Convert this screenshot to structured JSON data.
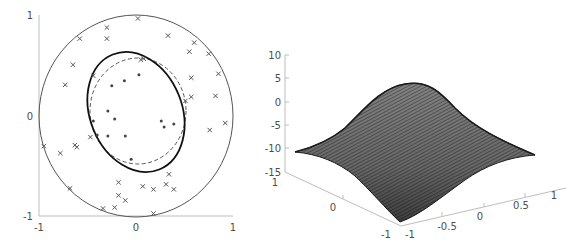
{
  "chart_data": [
    {
      "type": "scatter",
      "title": "",
      "xlabel": "",
      "ylabel": "",
      "xlim": [
        -1,
        1
      ],
      "ylim": [
        -1,
        1
      ],
      "grid": false,
      "x_ticks": [
        "-1",
        "0",
        "1"
      ],
      "y_ticks": [
        "-1",
        "0",
        "1"
      ],
      "curves": [
        {
          "name": "outer unit circle",
          "style": "solid thin",
          "shape": "circle",
          "center": [
            0,
            0
          ],
          "radius": 1.0
        },
        {
          "name": "true boundary",
          "style": "dashed",
          "shape": "circle",
          "center": [
            0.02,
            0.05
          ],
          "radius": 0.5
        },
        {
          "name": "learned boundary",
          "style": "solid thick",
          "shape": "ellipse",
          "center": [
            0.0,
            0.02
          ],
          "rx": 0.5,
          "ry": 0.58,
          "rotation_deg": -30
        }
      ],
      "series": [
        {
          "name": "outer samples",
          "marker": "x",
          "points": [
            [
              0.02,
              0.97
            ],
            [
              -0.3,
              0.88
            ],
            [
              -0.3,
              0.77
            ],
            [
              -0.58,
              0.77
            ],
            [
              0.33,
              0.8
            ],
            [
              0.6,
              0.73
            ],
            [
              0.55,
              0.64
            ],
            [
              0.75,
              0.62
            ],
            [
              0.85,
              0.42
            ],
            [
              0.57,
              0.38
            ],
            [
              -0.65,
              0.51
            ],
            [
              -0.73,
              0.31
            ],
            [
              -0.44,
              0.4
            ],
            [
              0.05,
              0.56
            ],
            [
              0.08,
              0.57
            ],
            [
              0.57,
              0.19
            ],
            [
              0.51,
              0.15
            ],
            [
              0.82,
              0.2
            ],
            [
              0.92,
              -0.07
            ],
            [
              0.76,
              -0.14
            ],
            [
              -0.47,
              -0.21
            ],
            [
              -0.95,
              -0.3
            ],
            [
              -0.78,
              -0.37
            ],
            [
              -0.63,
              -0.29
            ],
            [
              -0.61,
              -0.31
            ],
            [
              0.34,
              -0.58
            ],
            [
              -0.18,
              -0.66
            ],
            [
              0.07,
              -0.7
            ],
            [
              0.18,
              -0.73
            ],
            [
              0.31,
              -0.68
            ],
            [
              0.39,
              -0.73
            ],
            [
              -0.68,
              -0.72
            ],
            [
              -0.18,
              -0.79
            ],
            [
              -0.11,
              -0.84
            ],
            [
              -0.34,
              -0.92
            ],
            [
              -0.22,
              -0.91
            ],
            [
              0.18,
              -0.97
            ]
          ]
        },
        {
          "name": "inner samples",
          "marker": "dot",
          "points": [
            [
              0.03,
              0.41
            ],
            [
              -0.12,
              0.35
            ],
            [
              -0.25,
              0.3
            ],
            [
              -0.29,
              0.05
            ],
            [
              -0.22,
              -0.03
            ],
            [
              -0.44,
              -0.05
            ],
            [
              -0.4,
              -0.19
            ],
            [
              -0.29,
              -0.2
            ],
            [
              -0.11,
              -0.2
            ],
            [
              0.26,
              -0.05
            ],
            [
              0.29,
              -0.11
            ],
            [
              0.39,
              -0.08
            ],
            [
              -0.05,
              -0.43
            ]
          ]
        }
      ]
    },
    {
      "type": "surface",
      "title": "",
      "xlabel": "",
      "ylabel": "",
      "zlabel": "",
      "x_ticks": [
        "-1",
        "-0.5",
        "0",
        "0.5",
        "1"
      ],
      "y_ticks": [
        "-1",
        "0",
        "1"
      ],
      "z_ticks": [
        "10",
        "5",
        "0",
        "-5",
        "-10",
        "-15"
      ],
      "xlim": [
        -1,
        1
      ],
      "ylim": [
        -1,
        1
      ],
      "zlim": [
        -15,
        10
      ],
      "description": "Gaussian bump mesh surface: peak about 4 at center (0,0), corners about -11",
      "z_center": 4,
      "z_corner": -11,
      "mesh_color": "#333333"
    }
  ],
  "left_plot": {
    "x_tick_labels": [
      "-1",
      "0",
      "1"
    ],
    "y_tick_labels": [
      "1",
      "0",
      "-1"
    ]
  },
  "right_plot": {
    "z_tick_labels": [
      "10",
      "5",
      "0",
      "-5",
      "-10",
      "-15"
    ],
    "left_axis_labels": [
      "1",
      "0",
      "-1"
    ],
    "right_axis_labels": [
      "-1",
      "-0.5",
      "0",
      "0.5",
      "1"
    ]
  }
}
